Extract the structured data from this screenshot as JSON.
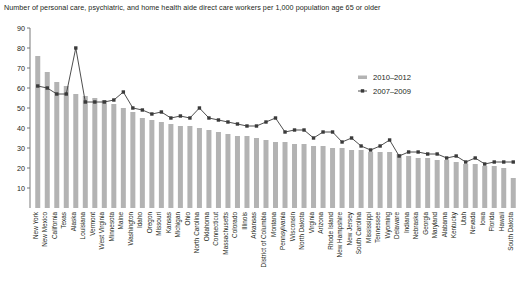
{
  "chart_data": {
    "type": "bar",
    "title": "Number of personal care, psychiatric, and home health aide direct care workers per 1,000 population age 65 or older",
    "xlabel": "",
    "ylabel": "",
    "ylim": [
      0,
      90
    ],
    "ytick_step": 10,
    "yticks": [
      0,
      10,
      20,
      30,
      40,
      50,
      60,
      70,
      80,
      90
    ],
    "ytick_labels": [
      "",
      "10",
      "20",
      "30",
      "40",
      "50",
      "60",
      "70",
      "80",
      "90"
    ],
    "grid": false,
    "legend_position": "upper-right",
    "categories": [
      "New York",
      "New Mexico",
      "California",
      "Texas",
      "Alaska",
      "Louisiana",
      "Vermont",
      "West Virginia",
      "Minnesota",
      "Maine",
      "Washington",
      "Idaho",
      "Oregon",
      "Missouri",
      "Kansas",
      "Michigan",
      "Ohio",
      "North Carolina",
      "Oklahoma",
      "Connecticut",
      "Massachusetts",
      "Colorado",
      "Illinois",
      "Arkansas",
      "District of Columbia",
      "Montana",
      "Pennsylvania",
      "Wisconsin",
      "North Dakota",
      "Virginia",
      "Arizona",
      "Rhode Island",
      "New Hampshire",
      "New Jersey",
      "South Carolina",
      "Mississippi",
      "Tennessee",
      "Wyoming",
      "Delaware",
      "Indiana",
      "Nebraska",
      "Georgia",
      "Maryland",
      "Alabama",
      "Kentucky",
      "Utah",
      "Nevada",
      "Iowa",
      "Florida",
      "Hawaii",
      "South Dakota"
    ],
    "series": [
      {
        "name": "2010–2012",
        "render": "bar",
        "color": "#b3b3b3",
        "values": [
          76,
          68,
          63,
          61,
          57,
          56,
          55,
          54,
          52,
          50,
          48,
          45,
          44,
          43,
          42,
          41,
          41,
          40,
          39,
          38,
          37,
          36,
          36,
          35,
          34,
          33,
          33,
          32,
          32,
          31,
          31,
          30,
          30,
          29,
          29,
          28,
          28,
          28,
          27,
          26,
          25,
          25,
          24,
          24,
          23,
          22,
          22,
          21,
          21,
          20,
          15
        ]
      },
      {
        "name": "2007–2009",
        "render": "line-marker",
        "color": "#3a3a3a",
        "values": [
          61,
          60,
          57,
          57,
          80,
          53,
          53,
          53,
          54,
          58,
          50,
          49,
          47,
          48,
          45,
          46,
          45,
          50,
          45,
          44,
          43,
          42,
          41,
          41,
          43,
          45,
          38,
          39,
          39,
          35,
          38,
          38,
          33,
          35,
          31,
          29,
          31,
          34,
          26,
          28,
          28,
          27,
          27,
          25,
          26,
          23,
          25,
          22,
          23,
          23,
          23
        ]
      }
    ]
  },
  "legend": {
    "items": [
      {
        "label": "2010–2012",
        "marker": "bar-swatch",
        "color": "#b3b3b3"
      },
      {
        "label": "2007–2009",
        "marker": "point-swatch",
        "color": "#3a3a3a"
      }
    ]
  }
}
